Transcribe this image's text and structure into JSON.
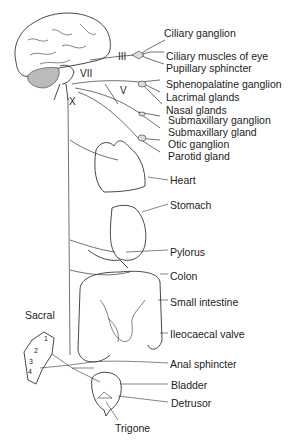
{
  "diagram": {
    "cranial_nerves": [
      {
        "id": "III",
        "label": "III",
        "x": 118,
        "y": 51
      },
      {
        "id": "VII",
        "label": "VII",
        "x": 80,
        "y": 68
      },
      {
        "id": "V",
        "label": "V",
        "x": 120,
        "y": 85
      },
      {
        "id": "X",
        "label": "X",
        "x": 69,
        "y": 96
      }
    ],
    "labels": [
      {
        "text": "Ciliary ganglion",
        "x": 164,
        "y": 27
      },
      {
        "text": "Ciliary muscles of eye",
        "x": 166,
        "y": 50
      },
      {
        "text": "Pupillary sphincter",
        "x": 166,
        "y": 62
      },
      {
        "text": "Sphenopalatine ganglion",
        "x": 166,
        "y": 78
      },
      {
        "text": "Lacrimal glands",
        "x": 166,
        "y": 91
      },
      {
        "text": "Nasal glands",
        "x": 166,
        "y": 104
      },
      {
        "text": "Submaxillary ganglion",
        "x": 168,
        "y": 114
      },
      {
        "text": "Submaxillary gland",
        "x": 168,
        "y": 126
      },
      {
        "text": "Otic ganglion",
        "x": 168,
        "y": 138
      },
      {
        "text": "Parotid gland",
        "x": 168,
        "y": 150
      },
      {
        "text": "Heart",
        "x": 170,
        "y": 177
      },
      {
        "text": "Stomach",
        "x": 170,
        "y": 201
      },
      {
        "text": "Pylorus",
        "x": 170,
        "y": 248
      },
      {
        "text": "Colon",
        "x": 170,
        "y": 272
      },
      {
        "text": "Small intestine",
        "x": 170,
        "y": 298
      },
      {
        "text": "Ileocaecal valve",
        "x": 170,
        "y": 331
      },
      {
        "text": "Anal sphincter",
        "x": 170,
        "y": 361
      },
      {
        "text": "Bladder",
        "x": 171,
        "y": 382
      },
      {
        "text": "Detrusor",
        "x": 171,
        "y": 400
      },
      {
        "text": "Trigone",
        "x": 115,
        "y": 424
      },
      {
        "text": "Sacral",
        "x": 25,
        "y": 311
      }
    ],
    "sacral_segments": [
      "1",
      "2",
      "3",
      "4"
    ]
  }
}
